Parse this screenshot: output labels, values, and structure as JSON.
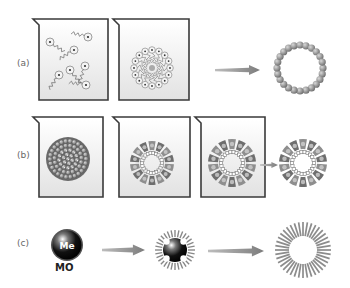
{
  "rows": [
    {
      "id": "a",
      "label": "(a)"
    },
    {
      "id": "b",
      "label": "(b)"
    },
    {
      "id": "c",
      "label": "(c)"
    }
  ],
  "labels": {
    "me": "Me",
    "mo": "MO"
  },
  "colors": {
    "beaker_stroke": "#3a3a3a",
    "beaker_fill_top": "#ffffff",
    "beaker_fill_bottom": "#e4e4e4",
    "arrow": "#8a8a8a",
    "sphere_dark": "#1a1a1a",
    "ring_bead": "#8c8c8c",
    "segment": "#7a7a7a",
    "rod": "#888888"
  }
}
